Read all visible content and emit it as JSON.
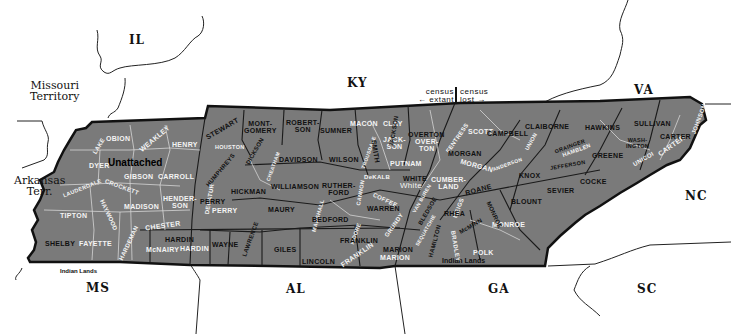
{
  "neighbors": {
    "il": "IL",
    "missouri": "Missouri Territory",
    "missouri_l1": "Missouri",
    "missouri_l2": "Territory",
    "arkansas_l1": "Arkansas",
    "arkansas_l2": "Terr.",
    "ky": "KY",
    "va": "VA",
    "nc": "NC",
    "sc": "SC",
    "ga": "GA",
    "al": "AL",
    "ms": "MS"
  },
  "annotations": {
    "unattached": "Unattached",
    "indian_lands_west": "Indian Lands",
    "indian_lands_east": "Indian Lands",
    "census_left_l1": "census",
    "census_left_l2": "← extant",
    "census_right_l1": "census",
    "census_right_l2": "lost →"
  },
  "counties_dark": {
    "stewart": "STEWART",
    "montgomery_l1": "MONT-",
    "montgomery_l2": "GOMERY",
    "robertson_l1": "ROBERT-",
    "robertson_l2": "SON",
    "sumner": "SUMNER",
    "smith": "SMITH",
    "jackson": "JACKSON",
    "overton": "OVERTON",
    "campbell": "CAMPBELL",
    "claiborne": "CLAIBORNE",
    "hawkins": "HAWKINS",
    "sullivan": "SULLIVAN",
    "carter": "CARTER",
    "washington_l1": "WASH-",
    "washington_l2": "INGTON",
    "greene": "GREENE",
    "grainger": "GRAINGER",
    "jefferson": "JEFFERSON",
    "cocke": "COCKE",
    "knox": "KNOX",
    "sevier": "SEVIER",
    "blount": "BLOUNT",
    "monroe": "MONROE",
    "mcminn": "McMINN",
    "rhea": "RHEA",
    "roane": "ROANE",
    "morgan": "MORGAN",
    "white": "WHITE",
    "bledsoe": "BLEDSOE",
    "hamilton": "HAMILTON",
    "marion": "MARION",
    "warren": "WARREN",
    "franklin": "FRANKLIN",
    "lincoln": "LINCOLN",
    "bedford": "BEDFORD",
    "rutherford_l1": "RUTHER-",
    "rutherford_l2": "FORD",
    "wilson": "WILSON",
    "davidson": "DAVIDSON",
    "williamson": "WILLIAMSON",
    "maury": "MAURY",
    "giles": "GILES",
    "lawrence": "LAWRENCE",
    "wayne": "WAYNE",
    "hardin": "HARDIN",
    "hickman": "HICKMAN",
    "dickson": "DICKSON",
    "humphreys": "HUMPHREYS",
    "perry": "PERRY",
    "shelby": "SHELBY"
  },
  "counties_light": {
    "lake": "LAKE",
    "obion": "OBION",
    "weakley": "WEAKLEY",
    "henry": "HENRY",
    "dyer": "DYER",
    "gibson": "GIBSON",
    "carroll": "CARROLL",
    "lauderdale": "LAUDERDALE",
    "crockett": "CROCKETT",
    "haywood": "HAYWOOD",
    "madison": "MADISON",
    "henderson_l1": "HENDER-",
    "henderson_l2": "SON",
    "tipton": "TIPTON",
    "fayette": "FAYETTE",
    "hardeman": "HARDEMAN",
    "chester": "CHESTER",
    "mcnairy": "McNAIRY",
    "hardin": "HARDIN",
    "decatur": "DECATUR",
    "perry": "PERRY",
    "houston": "HOUSTON",
    "macon": "MACON",
    "clay": "CLAY",
    "jackson_l1": "JACK-",
    "jackson_l2": "SON",
    "overton_l1": "OVER-",
    "overton_l2": "TON",
    "putnam": "PUTNAM",
    "dekalb": "DeKALB",
    "white": "White",
    "cumberland_l1": "CUMBER-",
    "cumberland_l2": "LAND",
    "fentress": "FENTRESS",
    "scott": "SCOTT",
    "morgan": "MORGAN",
    "anderson": "ANDERSON",
    "union": "UNION",
    "hamblen": "HAMBLEN",
    "unicoi": "UNICOI",
    "johnson": "JOHNSON",
    "carter": "CARTER",
    "meigs": "MEIGS",
    "monroe": "MONROE",
    "polk": "POLK",
    "bradley": "BRADLEY",
    "marion": "MARION",
    "franklin": "FRANKLIN",
    "grundy": "GRUNDY",
    "sequatchie": "SEQUATCHIE",
    "van_buren": "VAN BUREN",
    "coffee": "COFFEE",
    "moore": "MOORE",
    "marshall": "MARSHALL",
    "cannon": "CANNON",
    "trousdale": "TROUSDALE",
    "cheatham": "CHEATHAM"
  },
  "colors": {
    "land_fill": "#7d7d7d",
    "outer_border": "#111111",
    "county_line": "#1a1a1a",
    "modern_line": "#e6e6e6",
    "background": "#ffffff"
  }
}
